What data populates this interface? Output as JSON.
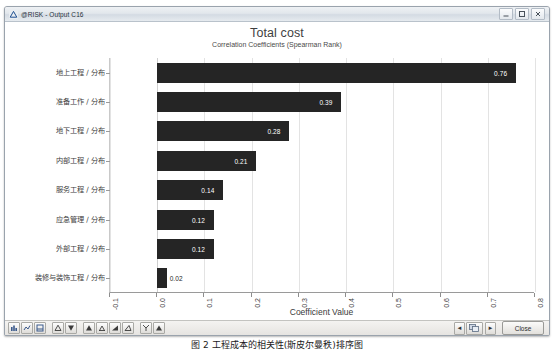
{
  "window": {
    "title": "@RISK - Output C16",
    "app_icon": "risk-logo-icon",
    "controls": {
      "minimize": "minimize-icon",
      "maximize": "maximize-icon",
      "close": "close-icon"
    }
  },
  "chart_data": {
    "type": "bar",
    "orientation": "horizontal",
    "title": "Total cost",
    "subtitle": "Correlation Coefficients (Spearman Rank)",
    "xlabel": "Coefficient Value",
    "ylabel": "",
    "xlim": [
      -0.1,
      0.8
    ],
    "xticks": [
      "-0.1",
      "0.0",
      "0.1",
      "0.2",
      "0.3",
      "0.4",
      "0.5",
      "0.6",
      "0.7",
      "0.8"
    ],
    "grid": true,
    "legend": false,
    "bar_color": "#252525",
    "categories": [
      "地上工程 / 分布",
      "准备工作 / 分布",
      "地下工程 / 分布",
      "内部工程 / 分布",
      "服务工程 / 分布",
      "应急管理 / 分布",
      "外部工程 / 分布",
      "装修与装饰工程 / 分布"
    ],
    "values": [
      0.76,
      0.39,
      0.28,
      0.21,
      0.14,
      0.12,
      0.12,
      0.02
    ],
    "value_labels": [
      "0.76",
      "0.39",
      "0.28",
      "0.21",
      "0.14",
      "0.12",
      "0.12",
      "0.02"
    ]
  },
  "toolbar": {
    "items": [
      {
        "name": "chart-type-1-icon"
      },
      {
        "name": "chart-type-2-icon"
      },
      {
        "name": "chart-type-3-icon"
      },
      {
        "name": "sort-ascending-icon"
      },
      {
        "name": "sort-descending-icon"
      },
      {
        "name": "scale-icon"
      },
      {
        "name": "percentile-icon"
      },
      {
        "name": "delimiter-icon"
      },
      {
        "name": "format-icon"
      },
      {
        "name": "axis-icon"
      },
      {
        "name": "export-icon"
      }
    ]
  },
  "navigation": {
    "prev_label": "◄",
    "next_label": "►",
    "page_icon": "window-list-icon",
    "close_label": "Close"
  },
  "caption": "图 2  工程成本的相关性(斯皮尔曼秩)排序图"
}
